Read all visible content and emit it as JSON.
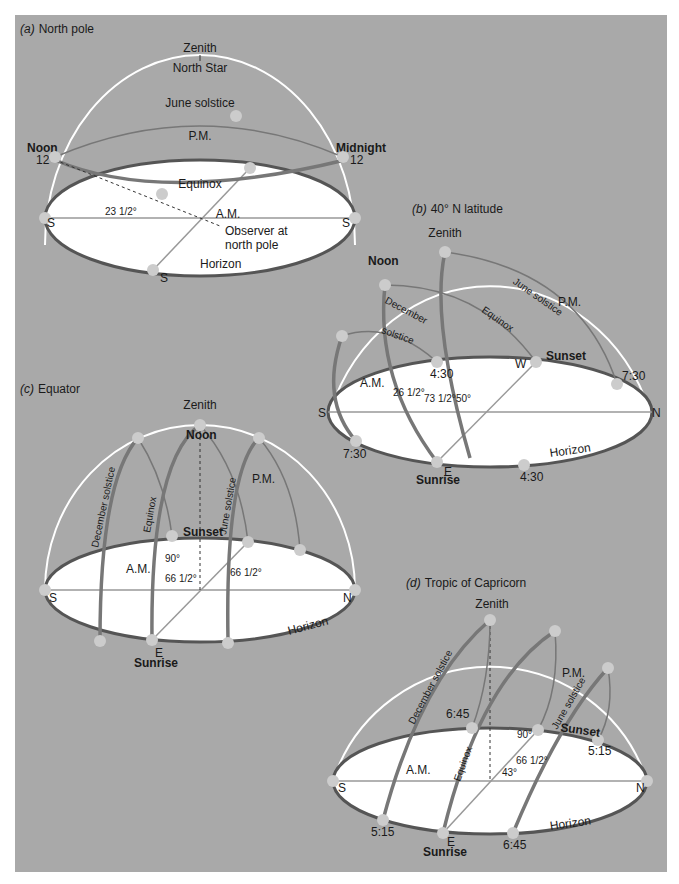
{
  "figure": {
    "background": "#a9a9a9",
    "horizon_fill": "#ffffff",
    "path_color": "#7a7a7a",
    "dome_color": "#ffffff"
  },
  "panel_a": {
    "title_letter": "(a)",
    "title": "North pole",
    "zenith": "Zenith",
    "north_star": "North Star",
    "june_solstice": "June solstice",
    "pm": "P.M.",
    "am": "A.M.",
    "noon": "Noon",
    "midnight": "Midnight",
    "equinox": "Equinox",
    "horizon": "Horizon",
    "angle": "23 1/2°",
    "observer": "Observer at",
    "observer2": "north pole",
    "south": "S",
    "noon_hour": "12",
    "midnight_hour": "12"
  },
  "panel_b": {
    "title_letter": "(b)",
    "title": "40° N latitude",
    "zenith": "Zenith",
    "noon": "Noon",
    "june_solstice": "June solstice",
    "equinox": "Equinox",
    "december": "December",
    "solstice": "solstice",
    "pm": "P.M.",
    "am": "A.M.",
    "sunset": "Sunset",
    "sunrise": "Sunrise",
    "horizon": "Horizon",
    "angle1": "26 1/2°",
    "angle2": "73 1/2°",
    "angle3": "50°",
    "south": "S",
    "north": "N",
    "east": "E",
    "west": "W",
    "time_430": "4:30",
    "time_730": "7:30"
  },
  "panel_c": {
    "title_letter": "(c)",
    "title": "Equator",
    "zenith": "Zenith",
    "noon": "Noon",
    "december_solstice": "December solstice",
    "equinox": "Equinox",
    "june_solstice": "June solstice",
    "pm": "P.M.",
    "am": "A.M.",
    "sunset": "Sunset",
    "sunrise": "Sunrise",
    "horizon": "Horizon",
    "angle90": "90°",
    "angle66a": "66 1/2°",
    "angle66b": "66 1/2°",
    "south": "S",
    "north": "N",
    "east": "E"
  },
  "panel_d": {
    "title_letter": "(d)",
    "title": "Tropic of Capricorn",
    "zenith": "Zenith",
    "december_solstice": "December solstice",
    "equinox": "Equinox",
    "june_solstice": "June solstice",
    "pm": "P.M.",
    "am": "A.M.",
    "sunset": "Sunset",
    "sunrise": "Sunrise",
    "horizon": "Horizon",
    "angle90": "90°",
    "angle66": "66 1/2°",
    "angle43": "43°",
    "south": "S",
    "north": "N",
    "east": "E",
    "time_515": "5:15",
    "time_645": "6:45"
  }
}
